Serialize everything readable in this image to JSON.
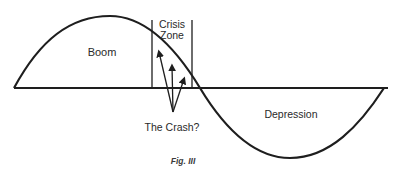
{
  "diagram": {
    "type": "business-cycle sine wave",
    "labels": {
      "boom": "Boom",
      "crisis_line1": "Crisis",
      "crisis_line2": "Zone",
      "depression": "Depression",
      "crash": "The Crash?",
      "caption": "Fig. III"
    },
    "colors": {
      "line": "#1e1e1e",
      "text": "#2a2a2a",
      "background": "#ffffff"
    }
  }
}
